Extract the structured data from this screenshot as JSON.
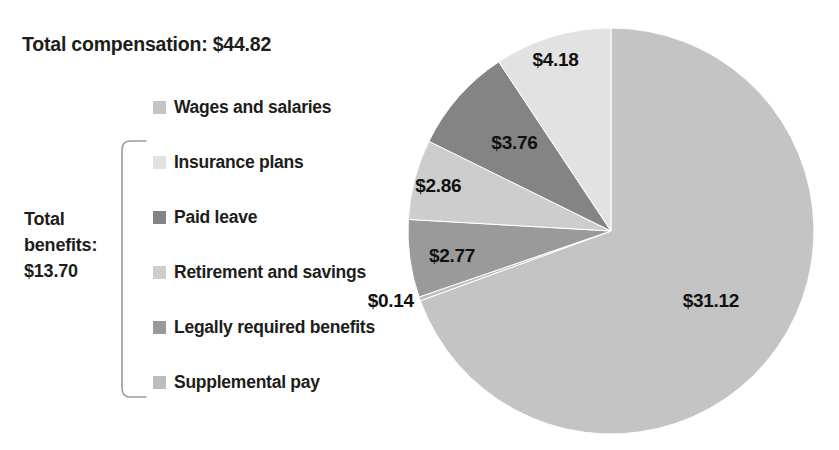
{
  "header": {
    "total_compensation_label": "Total compensation: $44.82"
  },
  "bracket": {
    "label_line1": "Total",
    "label_line2": "benefits:",
    "label_line3": "$13.70",
    "label_full": "Total benefits: $13.70"
  },
  "legend": {
    "items": [
      {
        "label": "Wages and salaries",
        "color": "#c4c4c4"
      },
      {
        "label": "Insurance plans",
        "color": "#e2e2e2"
      },
      {
        "label": "Paid leave",
        "color": "#848484"
      },
      {
        "label": "Retirement and savings",
        "color": "#cdcdcd"
      },
      {
        "label": "Legally required benefits",
        "color": "#9a9a9a"
      },
      {
        "label": "Supplemental pay",
        "color": "#bdbdbd"
      }
    ]
  },
  "chart_data": {
    "type": "pie",
    "title": "Total compensation: $44.82",
    "unit": "dollars per hour worked",
    "total": 44.82,
    "categories": [
      "Wages and salaries",
      "Supplemental pay",
      "Legally required benefits",
      "Retirement and savings",
      "Paid leave",
      "Insurance plans"
    ],
    "values": [
      31.12,
      0.14,
      2.77,
      2.86,
      3.76,
      4.18
    ],
    "labels": [
      "$31.12",
      "$0.14",
      "$2.77",
      "$2.86",
      "$3.76",
      "$4.18"
    ],
    "colors": [
      "#c4c4c4",
      "#bdbdbd",
      "#9a9a9a",
      "#cdcdcd",
      "#848484",
      "#e2e2e2"
    ],
    "start_angle_deg": 0,
    "direction": "clockwise",
    "legend_position": "left",
    "grid": false,
    "annotations": [
      "Total compensation: $44.82",
      "Total benefits: $13.70"
    ]
  }
}
